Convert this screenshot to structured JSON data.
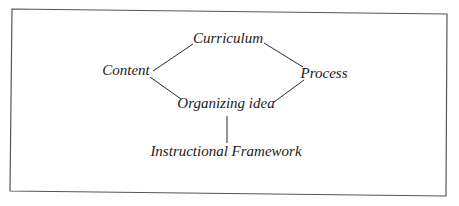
{
  "diagram": {
    "type": "concept-map",
    "frame": {
      "points": [
        [
          12,
          9
        ],
        [
          447,
          14
        ],
        [
          446,
          196
        ],
        [
          10,
          191
        ]
      ],
      "color": "#555555"
    },
    "nodes": [
      {
        "id": "curriculum",
        "label": "Curriculum",
        "x": 228,
        "y": 43
      },
      {
        "id": "content",
        "label": "Content",
        "x": 126,
        "y": 75
      },
      {
        "id": "process",
        "label": "Process",
        "x": 324,
        "y": 78
      },
      {
        "id": "organizing_idea",
        "label": "Organizing idea",
        "x": 226,
        "y": 108
      },
      {
        "id": "instructional_framework",
        "label": "Instructional Framework",
        "x": 226,
        "y": 156
      }
    ],
    "edges": [
      {
        "from": "content",
        "to": "curriculum",
        "x1": 153,
        "y1": 71,
        "x2": 193,
        "y2": 44
      },
      {
        "from": "curriculum",
        "to": "process",
        "x1": 264,
        "y1": 43,
        "x2": 303,
        "y2": 67
      },
      {
        "from": "content",
        "to": "organizing_idea",
        "x1": 150,
        "y1": 77,
        "x2": 181,
        "y2": 99
      },
      {
        "from": "organizing_idea",
        "to": "process",
        "x1": 274,
        "y1": 102,
        "x2": 304,
        "y2": 80
      },
      {
        "from": "organizing_idea",
        "to": "instructional_framework",
        "x1": 227,
        "y1": 116,
        "x2": 227,
        "y2": 143
      }
    ]
  }
}
